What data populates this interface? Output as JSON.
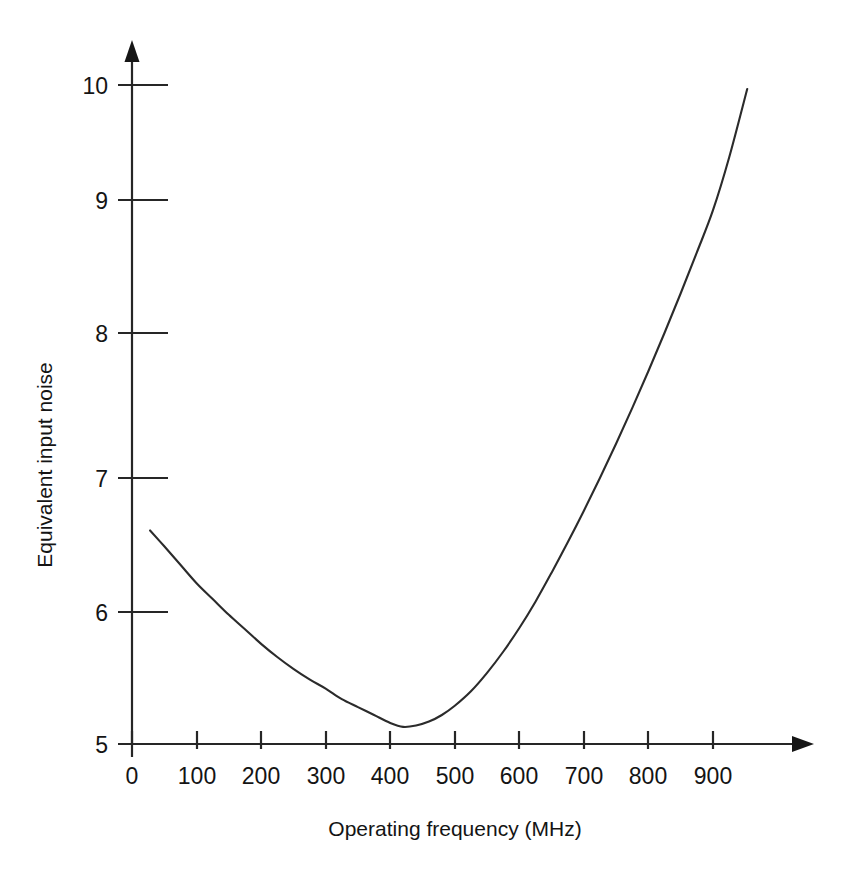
{
  "chart_data": {
    "type": "line",
    "title": "",
    "subtitle": "",
    "xlabel": "Operating frequency (MHz)",
    "ylabel": "Equivalent input noise",
    "xlim": [
      0,
      1000
    ],
    "ylim": [
      5,
      10
    ],
    "xticks": [
      0,
      100,
      200,
      300,
      400,
      500,
      600,
      700,
      800,
      900
    ],
    "xticklabels": [
      "0",
      "100",
      "200",
      "300",
      "400",
      "500",
      "600",
      "700",
      "800",
      "900"
    ],
    "yticks": [
      5,
      6,
      7,
      8,
      9,
      10
    ],
    "yticklabels": [
      "5",
      "6",
      "7",
      "8",
      "9",
      "10"
    ],
    "grid": false,
    "legend": null,
    "legend_position": "none",
    "axis_style": "arrow-tipped",
    "series": [
      {
        "name": "Equivalent input noise vs frequency",
        "color": "#2b2b2b",
        "x": [
          28,
          50,
          75,
          100,
          125,
          150,
          175,
          200,
          225,
          250,
          275,
          300,
          325,
          350,
          375,
          400,
          420,
          440,
          460,
          480,
          500,
          525,
          550,
          575,
          600,
          625,
          650,
          675,
          700,
          725,
          750,
          775,
          800,
          825,
          850,
          875,
          900,
          925,
          953
        ],
        "y": [
          6.62,
          6.5,
          6.36,
          6.22,
          6.1,
          5.98,
          5.87,
          5.76,
          5.66,
          5.57,
          5.49,
          5.42,
          5.34,
          5.28,
          5.22,
          5.16,
          5.13,
          5.14,
          5.17,
          5.22,
          5.29,
          5.4,
          5.54,
          5.7,
          5.88,
          6.08,
          6.3,
          6.53,
          6.77,
          7.02,
          7.28,
          7.55,
          7.83,
          8.12,
          8.42,
          8.73,
          9.05,
          9.45,
          9.97
        ]
      }
    ],
    "annotations": []
  },
  "axes": {
    "x_arrow": "arrow-right-icon",
    "y_arrow": "arrow-up-icon"
  }
}
